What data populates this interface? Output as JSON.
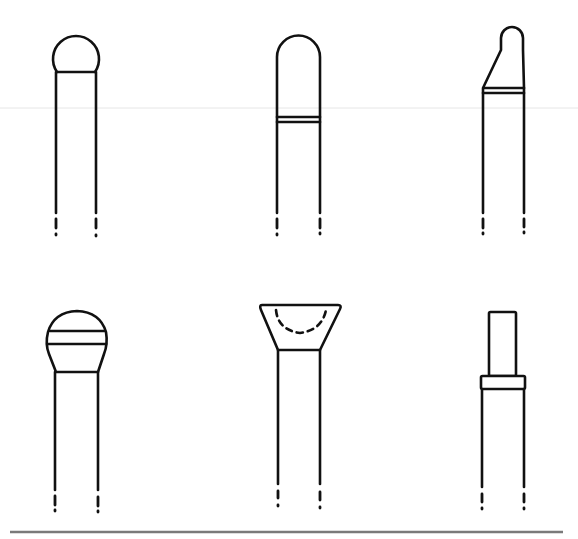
{
  "figure": {
    "ink_color": "#111111",
    "rule_color": "#7a7a7a",
    "background": "#ffffff"
  },
  "shapes": [
    {
      "id": 1,
      "row": 1,
      "col": 1,
      "name": "round-ball tip"
    },
    {
      "id": 2,
      "row": 1,
      "col": 2,
      "name": "bullet-nose tip with double band"
    },
    {
      "id": 3,
      "row": 1,
      "col": 3,
      "name": "tapered rounded tip with double band"
    },
    {
      "id": 4,
      "row": 2,
      "col": 1,
      "name": "banded dome tip"
    },
    {
      "id": 5,
      "row": 2,
      "col": 2,
      "name": "inverted cone (cup) tip with dashed inner curve"
    },
    {
      "id": 6,
      "row": 2,
      "col": 3,
      "name": "flat post tip with collar"
    }
  ]
}
